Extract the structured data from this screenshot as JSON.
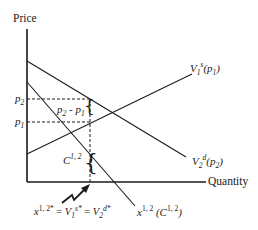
{
  "diagram": {
    "axes": {
      "y_label": "Price",
      "x_label": "Quantity"
    },
    "price_ticks": {
      "p2": {
        "base": "p",
        "sub": "2"
      },
      "p1": {
        "base": "p",
        "sub": "1"
      }
    },
    "annotations": {
      "price_gap": "p₂ - p₁",
      "price_gap_parts": {
        "a": "p",
        "a_sub": "2",
        "minus": " - ",
        "b": "p",
        "b_sub": "1"
      },
      "cost": {
        "base": "C",
        "sup": "1, 2"
      },
      "equilibrium": {
        "x_base": "x",
        "x_sup": "1, 2*",
        "eq1": " = ",
        "v1_base": "V",
        "v1_sub": "1",
        "v1_sup": "s*",
        "eq2": " = ",
        "v2_base": "V",
        "v2_sub": "2",
        "v2_sup": "d*"
      }
    },
    "curves": [
      {
        "id": "supply",
        "label_base": "V",
        "label_sub": "1",
        "label_sup": "s",
        "label_arg": "(p",
        "label_arg_sub": "1",
        "label_close": ")"
      },
      {
        "id": "demand",
        "label_base": "V",
        "label_sub": "2",
        "label_sup": "d",
        "label_arg": "(p",
        "label_arg_sub": "2",
        "label_close": ")"
      },
      {
        "id": "transport",
        "label_base": "x",
        "label_sup": "1, 2",
        "label_arg": " (C",
        "label_arg_sup": "1, 2",
        "label_close": ")"
      }
    ],
    "colors": {
      "line": "#1a1a1a",
      "background": "#ffffff"
    }
  }
}
